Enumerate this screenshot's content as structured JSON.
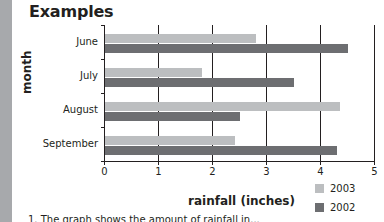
{
  "page": {
    "title": "Examples",
    "caption": "1. The graph shows the amount of rainfall in..."
  },
  "colors": {
    "series_2003": "#bcbec0",
    "series_2002": "#6d6e71",
    "axis": "#231f20",
    "left_strip": "#a7a9ac"
  },
  "chart_data": {
    "type": "bar",
    "orientation": "horizontal",
    "title": "",
    "xlabel": "rainfall (inches)",
    "ylabel": "month",
    "categories": [
      "June",
      "July",
      "August",
      "September"
    ],
    "series": [
      {
        "name": "2003",
        "values": [
          2.8,
          1.8,
          4.35,
          2.4
        ]
      },
      {
        "name": "2002",
        "values": [
          4.5,
          3.5,
          2.5,
          4.3
        ]
      }
    ],
    "xlim": [
      0,
      5
    ],
    "x_ticks": [
      "0",
      "1",
      "2",
      "3",
      "4",
      "5"
    ],
    "grid": "vertical",
    "legend": {
      "position": "bottom-right",
      "entries": [
        "2003",
        "2002"
      ]
    }
  }
}
